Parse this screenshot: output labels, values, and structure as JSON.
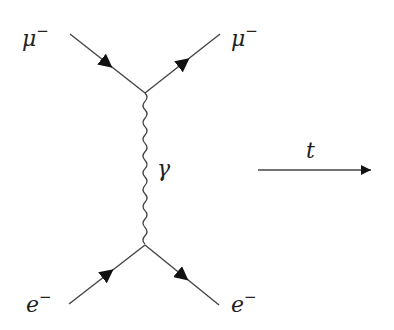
{
  "diagram": {
    "type": "feynman",
    "title": "",
    "particles": {
      "top_left": {
        "symbol": "μ",
        "charge": "−"
      },
      "top_right": {
        "symbol": "μ",
        "charge": "−"
      },
      "bottom_left": {
        "symbol": "e",
        "charge": "−"
      },
      "bottom_right": {
        "symbol": "e",
        "charge": "−"
      }
    },
    "propagator": {
      "symbol": "γ",
      "style": "wavy"
    },
    "time_axis": {
      "label": "t",
      "direction": "right"
    },
    "colors": {
      "line": "#3a3a3a",
      "background": "#ffffff"
    }
  }
}
